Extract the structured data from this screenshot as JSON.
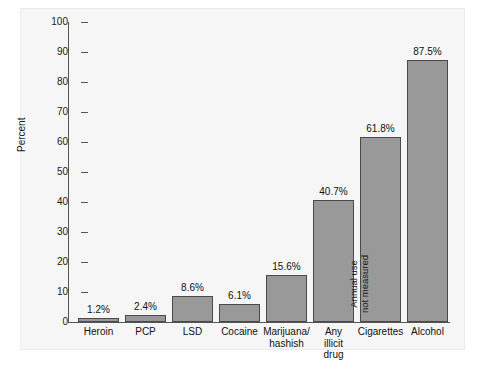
{
  "chart_data": {
    "type": "bar",
    "title": "",
    "subtitle": "",
    "xlabel": "",
    "ylabel": "Percent",
    "ylim": [
      0,
      100
    ],
    "yticks": [
      0,
      10,
      20,
      30,
      40,
      50,
      60,
      70,
      80,
      90,
      100
    ],
    "grid": false,
    "legend": null,
    "categories": [
      "Heroin",
      "PCP",
      "LSD",
      "Cocaine",
      "Marijuana/ hashish",
      "Any illicit drug",
      "Cigarettes",
      "Alcohol"
    ],
    "category_lines": [
      [
        "Heroin"
      ],
      [
        "PCP"
      ],
      [
        "LSD"
      ],
      [
        "Cocaine"
      ],
      [
        "Marijuana/",
        "hashish"
      ],
      [
        "Any",
        "illicit",
        "drug"
      ],
      [
        "Cigarettes"
      ],
      [
        "Alcohol"
      ]
    ],
    "values": [
      1.2,
      2.4,
      8.6,
      6.1,
      15.6,
      40.7,
      61.8,
      87.5
    ],
    "value_labels": [
      "1.2%",
      "2.4%",
      "8.6%",
      "6.1%",
      "15.6%",
      "40.7%",
      "61.8%",
      "87.5%"
    ],
    "annotations": [
      {
        "category": "Cigarettes",
        "lines": [
          "Annual use",
          "not measured"
        ],
        "rotated": true,
        "inside_bar": true
      }
    ],
    "colors": {
      "bar_fill": "#999999",
      "bar_border": "#4a4a4a",
      "axis": "#555555",
      "text": "#111111",
      "plot_background": "#f6f6f6",
      "figure_background": "#ffffff",
      "frame_border": "#ebebeb"
    }
  },
  "axis": {
    "y_label": "Percent",
    "tick_labels": [
      "100",
      "90",
      "80",
      "70",
      "60",
      "50",
      "40",
      "30",
      "20",
      "10",
      "0"
    ]
  },
  "bars": [
    {
      "label": "Heroin",
      "value_label": "1.2%",
      "lines": [
        "Heroin"
      ]
    },
    {
      "label": "PCP",
      "value_label": "2.4%",
      "lines": [
        "PCP"
      ]
    },
    {
      "label": "LSD",
      "value_label": "8.6%",
      "lines": [
        "LSD"
      ]
    },
    {
      "label": "Cocaine",
      "value_label": "6.1%",
      "lines": [
        "Cocaine"
      ]
    },
    {
      "label": "Marijuana",
      "value_label": "15.6%",
      "lines": [
        "Marijuana/",
        "hashish"
      ]
    },
    {
      "label": "AnyIllicit",
      "value_label": "40.7%",
      "lines": [
        "Any",
        "illicit",
        "drug"
      ]
    },
    {
      "label": "Cigarettes",
      "value_label": "61.8%",
      "lines": [
        "Cigarettes"
      ],
      "note": [
        "Annual use",
        "not measured"
      ]
    },
    {
      "label": "Alcohol",
      "value_label": "87.5%",
      "lines": [
        "Alcohol"
      ]
    }
  ]
}
